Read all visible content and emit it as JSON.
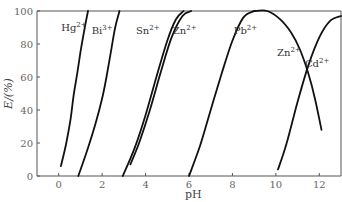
{
  "chart_data": {
    "type": "line",
    "title": "",
    "xlabel": "pH",
    "ylabel": "E/(%)",
    "xlim": [
      -1,
      13
    ],
    "ylim": [
      0,
      100
    ],
    "xticks": [
      0,
      2,
      4,
      6,
      8,
      10,
      12
    ],
    "yticks": [
      0,
      20,
      40,
      60,
      80,
      100
    ],
    "xtick_labels": [
      "0",
      "2",
      "4",
      "6",
      "8",
      "10",
      "12"
    ],
    "ytick_labels": [
      "0",
      "20",
      "40",
      "60",
      "80",
      "100"
    ],
    "grid": false,
    "legend": "none (inline labels)",
    "series": [
      {
        "name": "Hg2+",
        "label": "Hg",
        "charge": "2+",
        "x": [
          0.1,
          0.35,
          0.55,
          0.7,
          0.85,
          1.0,
          1.2,
          1.35
        ],
        "y": [
          6,
          20,
          35,
          50,
          62,
          75,
          90,
          100
        ]
      },
      {
        "name": "Bi3+",
        "label": "Bi",
        "charge": "3+",
        "x": [
          0.9,
          1.3,
          1.7,
          2.0,
          2.2,
          2.4,
          2.6,
          2.8
        ],
        "y": [
          0,
          15,
          32,
          47,
          60,
          75,
          90,
          100
        ]
      },
      {
        "name": "Sn2+",
        "label": "Sn",
        "charge": "2+",
        "x": [
          2.95,
          3.5,
          4.0,
          4.5,
          5.0,
          5.4,
          5.75
        ],
        "y": [
          0,
          17,
          37,
          60,
          82,
          95,
          100
        ]
      },
      {
        "name": "Zn2+",
        "label": "Zn",
        "charge": "2+",
        "x": [
          3.3,
          3.7,
          4.2,
          4.7,
          5.2,
          5.7,
          6.1
        ],
        "y": [
          7,
          20,
          40,
          63,
          84,
          97,
          100
        ]
      },
      {
        "name": "Pb2+",
        "label": "Pb",
        "charge": "2+",
        "x": [
          6.0,
          6.5,
          7.0,
          7.5,
          8.0,
          8.5,
          9.0
        ],
        "y": [
          0,
          18,
          40,
          62,
          82,
          96,
          100
        ]
      },
      {
        "name": "Zn2+ (high pH)",
        "label": "Zn",
        "charge": "2+",
        "x": [
          9.0,
          9.6,
          10.2,
          10.7,
          11.1,
          11.5,
          11.8,
          12.1
        ],
        "y": [
          100,
          100,
          95,
          87,
          77,
          62,
          47,
          28
        ]
      },
      {
        "name": "Cd2+",
        "label": "Cd",
        "charge": "2+",
        "x": [
          10.1,
          10.5,
          11.0,
          11.5,
          12.0,
          12.5,
          13.0
        ],
        "y": [
          4,
          20,
          45,
          67,
          84,
          94,
          97
        ]
      }
    ],
    "annotations": [
      {
        "text": "Hg",
        "sup": "2+",
        "x": 0.7,
        "y": 88
      },
      {
        "text": "Bi",
        "sup": "3+",
        "x": 2.0,
        "y": 86
      },
      {
        "text": "Sn",
        "sup": "2+",
        "x": 4.1,
        "y": 86
      },
      {
        "text": "Zn",
        "sup": "2+",
        "x": 5.8,
        "y": 86
      },
      {
        "text": "Pb",
        "sup": "2+",
        "x": 8.6,
        "y": 86
      },
      {
        "text": "Zn",
        "sup": "2+",
        "x": 10.6,
        "y": 73
      },
      {
        "text": "Cd",
        "sup": "2+",
        "x": 11.9,
        "y": 66
      }
    ]
  }
}
